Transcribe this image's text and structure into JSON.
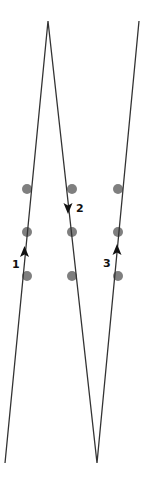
{
  "diagram": {
    "colors": {
      "line": "#333333",
      "dot": "#7f7f7f",
      "arrow": "#111111",
      "background": "#ffffff"
    },
    "path_points": [
      [
        5,
        463
      ],
      [
        48,
        21
      ],
      [
        97,
        463
      ],
      [
        139,
        21
      ]
    ],
    "dots": [
      {
        "x": 27,
        "y": 189
      },
      {
        "x": 27,
        "y": 232
      },
      {
        "x": 27,
        "y": 276
      },
      {
        "x": 72,
        "y": 189
      },
      {
        "x": 72,
        "y": 232
      },
      {
        "x": 72,
        "y": 276
      },
      {
        "x": 118,
        "y": 189
      },
      {
        "x": 118,
        "y": 232
      },
      {
        "x": 118,
        "y": 276
      }
    ],
    "arrows": [
      {
        "label": "1",
        "direction": "up",
        "x": 24.5,
        "y": 252,
        "label_x": 12,
        "label_y": 268
      },
      {
        "label": "2",
        "direction": "down",
        "x": 68,
        "y": 208,
        "label_x": 76,
        "label_y": 212
      },
      {
        "label": "3",
        "direction": "up",
        "x": 117,
        "y": 250,
        "label_x": 103,
        "label_y": 267
      }
    ]
  }
}
